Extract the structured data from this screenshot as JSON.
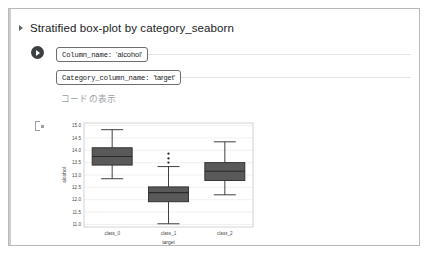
{
  "cell": {
    "title": "Stratified box-plot by category_seaborn",
    "disclosure_icon": "triangle-right-icon",
    "run_icon": "run-play-icon",
    "show_code_label": "コードの表示",
    "output_marker_icon": "output-bracket-icon"
  },
  "form": {
    "fields": [
      {
        "key": "Column_name:",
        "value": "'alcohol'"
      },
      {
        "key": "Category_column_name:",
        "value": "'target'"
      }
    ]
  },
  "colors": {
    "box_fill": "#595959",
    "box_edge": "#2b2b2b",
    "grid": "#e8e8e8",
    "frame": "#c8c8c8",
    "accent_rail": "#cfcfcf",
    "page_border": "#b9b9b9",
    "link_text": "#9aa0a6"
  },
  "chart_data": {
    "type": "box",
    "title": "",
    "xlabel": "target",
    "ylabel": "alcohol",
    "categories": [
      "class_0",
      "class_1",
      "class_2"
    ],
    "ylim": [
      10.9,
      15.1
    ],
    "yticks": [
      11.0,
      11.5,
      12.0,
      12.5,
      13.0,
      13.5,
      14.0,
      14.5,
      15.0
    ],
    "ytick_labels": [
      "11.0",
      "11.5",
      "12.0",
      "12.5",
      "13.0",
      "13.5",
      "14.0",
      "14.5",
      "15.0"
    ],
    "grid": true,
    "legend": "none",
    "boxes": [
      {
        "category": "class_0",
        "whisker_low": 12.85,
        "q1": 13.4,
        "median": 13.75,
        "q3": 14.1,
        "whisker_high": 14.83,
        "outliers": []
      },
      {
        "category": "class_1",
        "whisker_low": 11.03,
        "q1": 11.92,
        "median": 12.29,
        "q3": 12.52,
        "whisker_high": 13.34,
        "outliers": [
          13.5,
          13.67,
          13.86
        ]
      },
      {
        "category": "class_2",
        "whisker_low": 12.2,
        "q1": 12.78,
        "median": 13.15,
        "q3": 13.5,
        "whisker_high": 14.34,
        "outliers": []
      }
    ]
  }
}
